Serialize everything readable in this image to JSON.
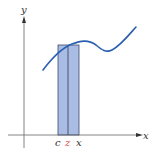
{
  "diagram": {
    "axes": {
      "x_label": "x",
      "y_label": "y",
      "color": "#555555"
    },
    "rectangle": {
      "fill": "#a9bde4",
      "stroke": "#3a4a6a"
    },
    "curve": {
      "color": "#2a5fb0"
    },
    "tick_labels": {
      "c": "c",
      "z": "z",
      "x": "x"
    },
    "colors": {
      "z_label": "#d9534f",
      "label": "#333333"
    }
  }
}
